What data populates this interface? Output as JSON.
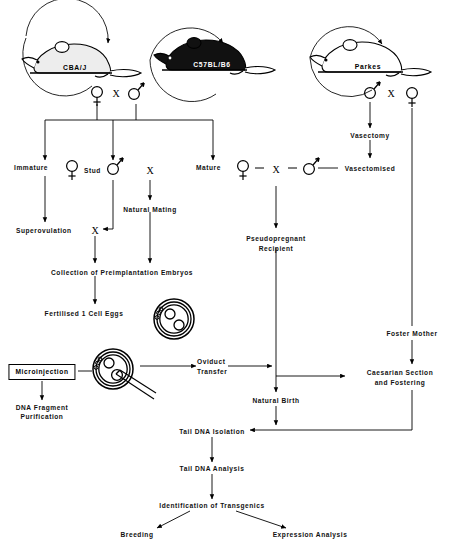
{
  "diagram": {
    "type": "flowchart",
    "strains": [
      {
        "id": "cba",
        "label": "CBA/J",
        "coat": "white",
        "x": 75,
        "y": 55
      },
      {
        "id": "c57",
        "label": "C57BL/B6",
        "coat": "black",
        "x": 212,
        "y": 50
      },
      {
        "id": "parkes",
        "label": "Parkes",
        "coat": "white",
        "x": 368,
        "y": 52
      }
    ],
    "crosses": [
      {
        "id": "cross-left",
        "left_symbol": "female",
        "operator": "X",
        "right_symbol": "male"
      },
      {
        "id": "cross-right",
        "left_symbol": "male",
        "operator": "X",
        "right_symbol": "female"
      }
    ],
    "operator": "X",
    "nodes": {
      "immature": "Immature",
      "stud": "Stud",
      "mature": "Mature",
      "natural_mating": "Natural Mating",
      "superovulation": "Superovulation",
      "collection": "Collection of Preimplantation Embryos",
      "fertilised_eggs": "Fertilised 1 Cell Eggs",
      "microinjection": "Microinjection",
      "dna_fragment_purification_line1": "DNA Fragment",
      "dna_fragment_purification_line2": "Purification",
      "oviduct_transfer_line1": "Oviduct",
      "oviduct_transfer_line2": "Transfer",
      "vasectomy": "Vasectomy",
      "vasectomised": "Vasectomised",
      "pseudopregnant_line1": "Pseudopregnant",
      "pseudopregnant_line2": "Recipient",
      "foster_mother": "Foster Mother",
      "caesarian_line1": "Caesarian Section",
      "caesarian_line2": "and Fostering",
      "natural_birth": "Natural Birth",
      "tail_dna_isolation": "Tail DNA Isolation",
      "tail_dna_analysis": "Tail DNA Analysis",
      "identification": "Identification of Transgenics",
      "breeding": "Breeding",
      "expression_analysis": "Expression Analysis"
    },
    "colors": {
      "ink": "#000000",
      "background": "#ffffff",
      "black_mouse_fill": "#111111",
      "white_mouse_fill": "#ffffff",
      "shadow_fill": "#e9e9e9"
    }
  }
}
